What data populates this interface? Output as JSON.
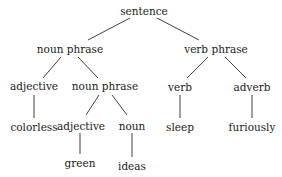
{
  "diagram": {
    "type": "parse-tree",
    "nodes": [
      {
        "id": "sentence",
        "label": "sentence",
        "x": 144,
        "y": 11
      },
      {
        "id": "np1",
        "label": "noun phrase",
        "x": 70,
        "y": 49
      },
      {
        "id": "vp",
        "label": "verb phrase",
        "x": 216,
        "y": 49
      },
      {
        "id": "adj1",
        "label": "adjective",
        "x": 34,
        "y": 86
      },
      {
        "id": "np2",
        "label": "noun phrase",
        "x": 105,
        "y": 86
      },
      {
        "id": "verb",
        "label": "verb",
        "x": 180,
        "y": 87
      },
      {
        "id": "adverb",
        "label": "adverb",
        "x": 252,
        "y": 87
      },
      {
        "id": "colorless",
        "label": "colorless",
        "x": 34,
        "y": 127
      },
      {
        "id": "adj2",
        "label": "adjective",
        "x": 81,
        "y": 126
      },
      {
        "id": "noun",
        "label": "noun",
        "x": 132,
        "y": 126
      },
      {
        "id": "sleep",
        "label": "sleep",
        "x": 180,
        "y": 127
      },
      {
        "id": "furiously",
        "label": "furiously",
        "x": 252,
        "y": 127
      },
      {
        "id": "green",
        "label": "green",
        "x": 80,
        "y": 163
      },
      {
        "id": "ideas",
        "label": "ideas",
        "x": 132,
        "y": 166
      }
    ],
    "edges": [
      {
        "from": "sentence",
        "to": "np1",
        "x1": 130,
        "y1": 18,
        "x2": 88,
        "y2": 40
      },
      {
        "from": "sentence",
        "to": "vp",
        "x1": 157,
        "y1": 18,
        "x2": 199,
        "y2": 40
      },
      {
        "from": "np1",
        "to": "adj1",
        "x1": 61,
        "y1": 57,
        "x2": 43,
        "y2": 78
      },
      {
        "from": "np1",
        "to": "np2",
        "x1": 78,
        "y1": 57,
        "x2": 98,
        "y2": 78
      },
      {
        "from": "vp",
        "to": "verb",
        "x1": 208,
        "y1": 57,
        "x2": 187,
        "y2": 78
      },
      {
        "from": "vp",
        "to": "adverb",
        "x1": 225,
        "y1": 57,
        "x2": 246,
        "y2": 78
      },
      {
        "from": "adj1",
        "to": "colorless",
        "x1": 34,
        "y1": 95,
        "x2": 34,
        "y2": 118
      },
      {
        "from": "np2",
        "to": "adj2",
        "x1": 99,
        "y1": 95,
        "x2": 86,
        "y2": 115
      },
      {
        "from": "np2",
        "to": "noun",
        "x1": 112,
        "y1": 95,
        "x2": 127,
        "y2": 115
      },
      {
        "from": "verb",
        "to": "sleep",
        "x1": 180,
        "y1": 95,
        "x2": 180,
        "y2": 118
      },
      {
        "from": "adverb",
        "to": "furiously",
        "x1": 252,
        "y1": 95,
        "x2": 252,
        "y2": 118
      },
      {
        "from": "adj2",
        "to": "green",
        "x1": 80,
        "y1": 133,
        "x2": 80,
        "y2": 154
      },
      {
        "from": "noun",
        "to": "ideas",
        "x1": 132,
        "y1": 133,
        "x2": 132,
        "y2": 157
      }
    ]
  },
  "colors": {
    "text": "#1a1a1a",
    "line": "#2a2a2a",
    "background": "#ffffff"
  }
}
